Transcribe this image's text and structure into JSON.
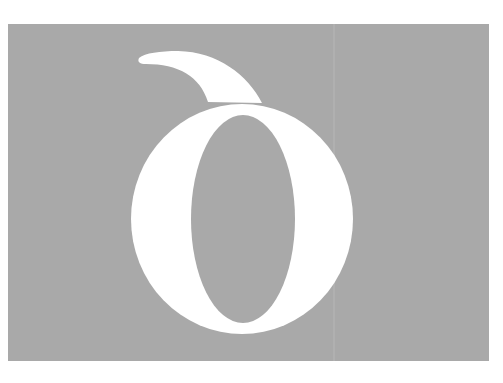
{
  "figure": {
    "glyph": "δ",
    "colors": {
      "page_background": "#ffffff",
      "panel_background": "#a9a9a9",
      "glyph_fill": "#ffffff",
      "counter_fill": "#a9a9a9"
    }
  }
}
